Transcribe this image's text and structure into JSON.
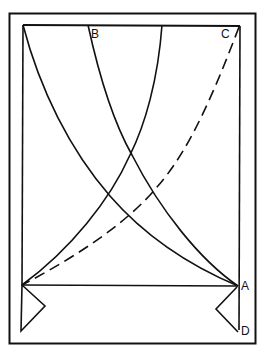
{
  "diagram": {
    "labels": {
      "b": "B",
      "c": "C",
      "a": "A",
      "d": "D"
    },
    "caption_partial": "… LINES FOR CROSS …",
    "colors": {
      "ink": "#111111",
      "background": "#ffffff"
    }
  }
}
